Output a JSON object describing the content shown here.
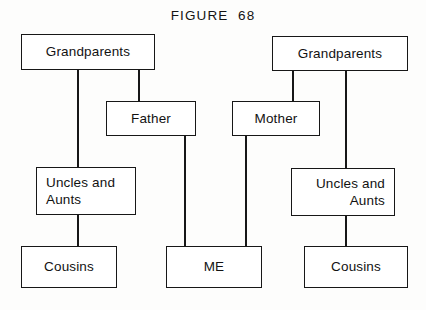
{
  "figure": {
    "title": "FIGURE  68",
    "type": "family-tree-diagram",
    "background_color": "#fdfdfc",
    "line_color": "#171717",
    "text_color": "#121212"
  },
  "nodes": [
    {
      "id": "grandparents-paternal",
      "label": "Grandparents",
      "side": "left",
      "generation": "grandparents",
      "align": "center",
      "x": 21,
      "y": 34,
      "w": 134,
      "h": 36
    },
    {
      "id": "grandparents-maternal",
      "label": "Grandparents",
      "side": "right",
      "generation": "grandparents",
      "align": "center",
      "x": 272,
      "y": 36,
      "w": 136,
      "h": 35
    },
    {
      "id": "father",
      "label": "Father",
      "side": "left",
      "generation": "parents",
      "align": "center",
      "x": 106,
      "y": 101,
      "w": 90,
      "h": 35
    },
    {
      "id": "mother",
      "label": "Mother",
      "side": "right",
      "generation": "parents",
      "align": "center",
      "x": 232,
      "y": 101,
      "w": 88,
      "h": 35
    },
    {
      "id": "uncles-aunts-paternal",
      "label": "Uncles and\nAunts",
      "side": "left",
      "generation": "parents",
      "align": "left",
      "x": 36,
      "y": 167,
      "w": 100,
      "h": 48
    },
    {
      "id": "uncles-aunts-maternal",
      "label": "Uncles and\nAunts",
      "side": "right",
      "generation": "parents",
      "align": "right",
      "x": 291,
      "y": 168,
      "w": 104,
      "h": 48
    },
    {
      "id": "cousins-paternal",
      "label": "Cousins",
      "side": "left",
      "generation": "children",
      "align": "center",
      "x": 21,
      "y": 246,
      "w": 96,
      "h": 42
    },
    {
      "id": "me",
      "label": "ME",
      "side": "center",
      "generation": "children",
      "align": "center",
      "x": 166,
      "y": 246,
      "w": 96,
      "h": 42
    },
    {
      "id": "cousins-maternal",
      "label": "Cousins",
      "side": "right",
      "generation": "children",
      "align": "center",
      "x": 304,
      "y": 246,
      "w": 104,
      "h": 42
    }
  ],
  "connectors": [
    {
      "id": "paternal-grandparents-to-uncles",
      "from": "grandparents-paternal",
      "to": "uncles-aunts-paternal",
      "x": 77,
      "y": 70,
      "length": 97
    },
    {
      "id": "paternal-uncles-to-cousins",
      "from": "uncles-aunts-paternal",
      "to": "cousins-paternal",
      "x": 77,
      "y": 215,
      "length": 31
    },
    {
      "id": "paternal-grandparents-to-father",
      "from": "grandparents-paternal",
      "to": "father",
      "x": 138,
      "y": 70,
      "length": 31
    },
    {
      "id": "father-to-me",
      "from": "father",
      "to": "me",
      "x": 184,
      "y": 136,
      "length": 110
    },
    {
      "id": "mother-to-me",
      "from": "mother",
      "to": "me",
      "x": 245,
      "y": 136,
      "length": 110
    },
    {
      "id": "maternal-grandparents-to-mother",
      "from": "grandparents-maternal",
      "to": "mother",
      "x": 292,
      "y": 71,
      "length": 30
    },
    {
      "id": "maternal-grandparents-to-uncles",
      "from": "grandparents-maternal",
      "to": "uncles-aunts-maternal",
      "x": 345,
      "y": 71,
      "length": 97
    },
    {
      "id": "maternal-uncles-to-cousins",
      "from": "uncles-aunts-maternal",
      "to": "cousins-maternal",
      "x": 345,
      "y": 216,
      "length": 30
    }
  ]
}
